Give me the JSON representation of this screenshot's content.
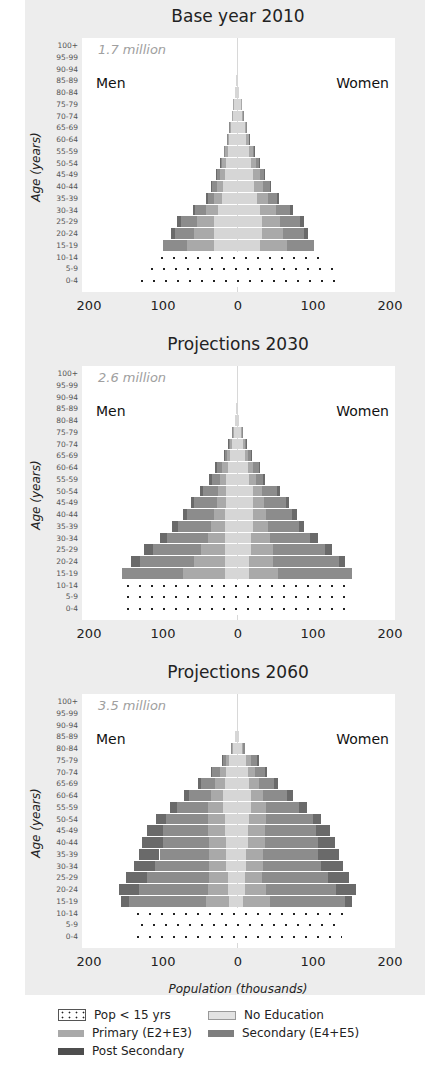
{
  "figure": {
    "x_axis_title": "Population (thousands)",
    "x_ticks": [
      "200",
      "100",
      "0",
      "100",
      "200"
    ],
    "y_axis_title": "Age (years)",
    "men_label": "Men",
    "women_label": "Women"
  },
  "legend": [
    {
      "key": "child",
      "label": "Pop < 15 yrs"
    },
    {
      "key": "noedu",
      "label": "No Education"
    },
    {
      "key": "prim",
      "label": "Primary (E2+E3)"
    },
    {
      "key": "sec",
      "label": "Secondary (E4+E5)"
    },
    {
      "key": "post",
      "label": "Post Secondary"
    }
  ],
  "colors": {
    "panel_bg": "#ededed",
    "no_education": "#d6d6d6",
    "primary": "#a9a9a9",
    "secondary": "#8c8c8c",
    "post_secondary": "#6a6a6a"
  },
  "chart_data": [
    {
      "type": "bar",
      "subtype": "population_pyramid",
      "title": "Base year 2010",
      "total_label": "1.7 million",
      "xlabel": "Population (thousands)",
      "ylabel": "Age (years)",
      "xlim": [
        -200,
        200
      ],
      "categories": [
        "0-4",
        "5-9",
        "10-14",
        "15-19",
        "20-24",
        "25-29",
        "30-34",
        "35-39",
        "40-44",
        "45-49",
        "50-54",
        "55-59",
        "60-64",
        "65-69",
        "70-74",
        "75-79",
        "80-84",
        "85-89",
        "90-94",
        "95-99",
        "100+"
      ],
      "series": [
        {
          "name": "Men total",
          "values": [
            130,
            118,
            104,
            95,
            85,
            77,
            57,
            40,
            34,
            27,
            22,
            17,
            13,
            10,
            7,
            5,
            3,
            1,
            0,
            0,
            0
          ]
        },
        {
          "name": "Women total",
          "values": [
            138,
            125,
            112,
            99,
            91,
            86,
            72,
            54,
            44,
            36,
            29,
            23,
            17,
            13,
            9,
            6,
            3,
            1,
            0,
            0,
            0
          ]
        },
        {
          "name": "Men No Education",
          "values": [
            0,
            0,
            0,
            30,
            30,
            30,
            25,
            20,
            18,
            16,
            14,
            12,
            10,
            8,
            6,
            4,
            3,
            1,
            0,
            0,
            0
          ]
        },
        {
          "name": "Men Primary",
          "values": [
            0,
            0,
            0,
            35,
            25,
            22,
            15,
            10,
            8,
            6,
            5,
            3,
            2,
            1,
            1,
            1,
            0,
            0,
            0,
            0,
            0
          ]
        },
        {
          "name": "Men Secondary",
          "values": [
            0,
            0,
            0,
            30,
            25,
            20,
            14,
            8,
            6,
            4,
            2,
            2,
            1,
            1,
            0,
            0,
            0,
            0,
            0,
            0,
            0
          ]
        },
        {
          "name": "Men Post Secondary",
          "values": [
            0,
            0,
            0,
            0,
            5,
            5,
            3,
            2,
            2,
            1,
            1,
            0,
            0,
            0,
            0,
            0,
            0,
            0,
            0,
            0,
            0
          ]
        },
        {
          "name": "Women No Education",
          "values": [
            0,
            0,
            0,
            30,
            32,
            32,
            30,
            26,
            22,
            20,
            18,
            15,
            12,
            10,
            7,
            5,
            3,
            1,
            0,
            0,
            0
          ]
        },
        {
          "name": "Women Primary",
          "values": [
            0,
            0,
            0,
            35,
            27,
            24,
            20,
            14,
            12,
            10,
            7,
            5,
            3,
            2,
            1,
            1,
            0,
            0,
            0,
            0,
            0
          ]
        },
        {
          "name": "Women Secondary",
          "values": [
            0,
            0,
            0,
            34,
            27,
            25,
            18,
            12,
            8,
            5,
            3,
            2,
            1,
            1,
            1,
            0,
            0,
            0,
            0,
            0,
            0
          ]
        },
        {
          "name": "Women Post Secondary",
          "values": [
            0,
            0,
            0,
            0,
            5,
            5,
            4,
            2,
            2,
            1,
            1,
            1,
            1,
            0,
            0,
            0,
            0,
            0,
            0,
            0,
            0
          ]
        }
      ]
    },
    {
      "type": "bar",
      "subtype": "population_pyramid",
      "title": "Projections 2030",
      "total_label": "2.6 million",
      "xlabel": "Population (thousands)",
      "ylabel": "Age (years)",
      "xlim": [
        -200,
        200
      ],
      "categories": [
        "0-4",
        "5-9",
        "10-14",
        "15-19",
        "20-24",
        "25-29",
        "30-34",
        "35-39",
        "40-44",
        "45-49",
        "50-54",
        "55-59",
        "60-64",
        "65-69",
        "70-74",
        "75-79",
        "80-84",
        "85-89",
        "90-94",
        "95-99",
        "100+"
      ],
      "series": [
        {
          "name": "Men total",
          "values": [
            148,
            148,
            148,
            148,
            137,
            120,
            100,
            84,
            70,
            60,
            48,
            36,
            29,
            17,
            11,
            6,
            2,
            1,
            0,
            0,
            0
          ]
        },
        {
          "name": "Women total",
          "values": [
            148,
            148,
            148,
            148,
            139,
            122,
            104,
            86,
            77,
            67,
            56,
            36,
            30,
            19,
            13,
            7,
            2,
            1,
            0,
            0,
            0
          ]
        },
        {
          "name": "Men No Education",
          "values": [
            0,
            0,
            0,
            15,
            15,
            16,
            16,
            16,
            15,
            14,
            14,
            14,
            12,
            9,
            7,
            4,
            2,
            1,
            0,
            0,
            0
          ]
        },
        {
          "name": "Men Primary",
          "values": [
            0,
            0,
            0,
            55,
            40,
            30,
            22,
            18,
            15,
            12,
            10,
            8,
            7,
            4,
            2,
            1,
            0,
            0,
            0,
            0,
            0
          ]
        },
        {
          "name": "Men Secondary",
          "values": [
            0,
            0,
            0,
            78,
            70,
            62,
            52,
            42,
            34,
            30,
            20,
            10,
            7,
            3,
            1,
            1,
            0,
            0,
            0,
            0,
            0
          ]
        },
        {
          "name": "Men Post Secondary",
          "values": [
            0,
            0,
            0,
            0,
            12,
            12,
            10,
            8,
            6,
            4,
            4,
            4,
            3,
            1,
            1,
            0,
            0,
            0,
            0,
            0,
            0
          ]
        },
        {
          "name": "Women No Education",
          "values": [
            0,
            0,
            0,
            15,
            16,
            18,
            18,
            20,
            20,
            20,
            20,
            16,
            14,
            10,
            8,
            5,
            2,
            1,
            0,
            0,
            0
          ]
        },
        {
          "name": "Women Primary",
          "values": [
            0,
            0,
            0,
            38,
            30,
            28,
            24,
            20,
            18,
            15,
            12,
            8,
            7,
            4,
            2,
            1,
            0,
            0,
            0,
            0,
            0
          ]
        },
        {
          "name": "Women Secondary",
          "values": [
            0,
            0,
            0,
            95,
            85,
            68,
            52,
            40,
            33,
            28,
            20,
            10,
            7,
            4,
            2,
            1,
            0,
            0,
            0,
            0,
            0
          ]
        },
        {
          "name": "Women Post Secondary",
          "values": [
            0,
            0,
            0,
            0,
            8,
            8,
            10,
            6,
            6,
            4,
            4,
            2,
            2,
            1,
            1,
            0,
            0,
            0,
            0,
            0,
            0
          ]
        }
      ]
    },
    {
      "type": "bar",
      "subtype": "population_pyramid",
      "title": "Projections 2060",
      "total_label": "3.5 million",
      "xlabel": "Population (thousands)",
      "ylabel": "Age (years)",
      "xlim": [
        -200,
        200
      ],
      "categories": [
        "0-4",
        "5-9",
        "10-14",
        "15-19",
        "20-24",
        "25-29",
        "30-34",
        "35-39",
        "40-44",
        "45-49",
        "50-54",
        "55-59",
        "60-64",
        "65-69",
        "70-74",
        "75-79",
        "80-84",
        "85-89",
        "90-94",
        "95-99",
        "100+"
      ],
      "series": [
        {
          "name": "Men total",
          "values": [
            135,
            130,
            135,
            150,
            152,
            143,
            133,
            127,
            122,
            116,
            104,
            87,
            69,
            50,
            33,
            19,
            8,
            2,
            0,
            0,
            0
          ]
        },
        {
          "name": "Women total",
          "values": [
            135,
            132,
            142,
            149,
            153,
            145,
            137,
            132,
            127,
            120,
            108,
            90,
            72,
            53,
            39,
            28,
            10,
            2,
            0,
            0,
            0
          ]
        },
        {
          "name": "Men No Education",
          "values": [
            0,
            0,
            0,
            10,
            12,
            12,
            14,
            14,
            14,
            16,
            16,
            18,
            18,
            16,
            14,
            10,
            6,
            2,
            0,
            0,
            0
          ]
        },
        {
          "name": "Men Primary",
          "values": [
            0,
            0,
            0,
            30,
            25,
            24,
            22,
            22,
            22,
            22,
            22,
            20,
            16,
            12,
            8,
            4,
            1,
            0,
            0,
            0,
            0
          ]
        },
        {
          "name": "Men Secondary",
          "values": [
            0,
            0,
            0,
            100,
            90,
            80,
            70,
            64,
            60,
            58,
            54,
            39,
            28,
            18,
            10,
            4,
            1,
            0,
            0,
            0,
            0
          ]
        },
        {
          "name": "Men Post Secondary",
          "values": [
            0,
            0,
            0,
            10,
            25,
            27,
            27,
            27,
            26,
            20,
            12,
            10,
            7,
            4,
            1,
            1,
            0,
            0,
            0,
            0,
            0
          ]
        },
        {
          "name": "Women No Education",
          "values": [
            0,
            0,
            0,
            8,
            10,
            10,
            12,
            12,
            14,
            14,
            16,
            18,
            18,
            16,
            14,
            12,
            6,
            2,
            0,
            0,
            0
          ]
        },
        {
          "name": "Women Primary",
          "values": [
            0,
            0,
            0,
            35,
            28,
            22,
            22,
            22,
            22,
            22,
            22,
            20,
            16,
            12,
            9,
            6,
            2,
            0,
            0,
            0,
            0
          ]
        },
        {
          "name": "Women Secondary",
          "values": [
            0,
            0,
            0,
            96,
            90,
            85,
            75,
            70,
            68,
            66,
            60,
            42,
            30,
            20,
            13,
            8,
            2,
            0,
            0,
            0,
            0
          ]
        },
        {
          "name": "Women Post Secondary",
          "values": [
            0,
            0,
            0,
            10,
            25,
            28,
            28,
            28,
            23,
            18,
            10,
            10,
            8,
            5,
            3,
            2,
            0,
            0,
            0,
            0,
            0
          ]
        }
      ]
    }
  ]
}
